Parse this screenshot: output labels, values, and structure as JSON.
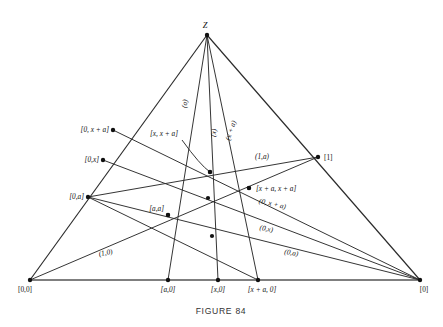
{
  "figure": {
    "caption": "FIGURE 84",
    "apex_label": "Z",
    "ink_color": "#2a2a2a",
    "baseline_color": "#555555",
    "background_color": "#ffffff"
  },
  "vertices": {
    "apex": {
      "label": "Z",
      "x": 207,
      "y": 35
    },
    "bottom_left": {
      "label": "[0,0]",
      "x": 30,
      "y": 280
    },
    "bottom_right": {
      "label": "[0]",
      "x": 420,
      "y": 280
    }
  },
  "points": [
    {
      "name": "apex-z",
      "label": "Z",
      "x": 207,
      "y": 35,
      "lx": 205,
      "ly": 28,
      "anchor": "middle",
      "italic": true
    },
    {
      "name": "origin",
      "label": "[0,0]",
      "x": 30,
      "y": 280,
      "lx": 18,
      "ly": 292,
      "anchor": "start",
      "italic": false
    },
    {
      "name": "pt-a0",
      "label": "[a,0]",
      "x": 168,
      "y": 280,
      "lx": 168,
      "ly": 292,
      "anchor": "middle",
      "italic": true
    },
    {
      "name": "pt-x0",
      "label": "[x,0]",
      "x": 218,
      "y": 280,
      "lx": 218,
      "ly": 292,
      "anchor": "middle",
      "italic": true
    },
    {
      "name": "pt-xa0",
      "label": "[x + a, 0]",
      "x": 258,
      "y": 280,
      "lx": 262,
      "ly": 292,
      "anchor": "middle",
      "italic": true
    },
    {
      "name": "pt-zero",
      "label": "[0]",
      "x": 420,
      "y": 280,
      "lx": 424,
      "ly": 292,
      "anchor": "middle",
      "italic": false
    },
    {
      "name": "pt-0xa",
      "label": "[0, x + a]",
      "x": 113,
      "y": 130,
      "lx": 109,
      "ly": 132,
      "anchor": "end",
      "italic": true
    },
    {
      "name": "pt-0x",
      "label": "[0,x]",
      "x": 103,
      "y": 160,
      "lx": 99,
      "ly": 162,
      "anchor": "end",
      "italic": true
    },
    {
      "name": "pt-0a",
      "label": "[0,a]",
      "x": 88,
      "y": 197,
      "lx": 84,
      "ly": 199,
      "anchor": "end",
      "italic": true
    },
    {
      "name": "pt-one",
      "label": "[1]",
      "x": 318,
      "y": 157,
      "lx": 324,
      "ly": 160,
      "anchor": "start",
      "italic": false
    },
    {
      "name": "pt-aa",
      "label": "[a,a]",
      "x": 168,
      "y": 215,
      "lx": 164,
      "ly": 211,
      "anchor": "end",
      "italic": true
    },
    {
      "name": "pt-x-xa",
      "label": "[x, x + a]",
      "x": 210,
      "y": 172,
      "lx": 150,
      "ly": 136,
      "anchor": "start",
      "italic": true
    },
    {
      "name": "pt-xa-xa",
      "label": "[x + a, x + a]",
      "x": 249,
      "y": 188,
      "lx": 256,
      "ly": 191,
      "anchor": "start",
      "italic": true
    }
  ],
  "line_labels": [
    {
      "name": "label-a",
      "text": "(a)",
      "x": 187,
      "y": 104,
      "rotate": -80,
      "italic": true
    },
    {
      "name": "label-x",
      "text": "(x)",
      "x": 216,
      "y": 133,
      "rotate": -82,
      "italic": true
    },
    {
      "name": "label-x-a",
      "text": "(x + a)",
      "x": 233,
      "y": 131,
      "rotate": -72,
      "italic": true
    },
    {
      "name": "label-1-a",
      "text": "(1,a)",
      "x": 262,
      "y": 159,
      "rotate": 0,
      "italic": true
    },
    {
      "name": "label-0-x-a",
      "text": "(0, x + a)",
      "x": 272,
      "y": 206,
      "rotate": 13,
      "italic": true
    },
    {
      "name": "label-0-x",
      "text": "(0,x)",
      "x": 266,
      "y": 231,
      "rotate": 10,
      "italic": true
    },
    {
      "name": "label-0-a",
      "text": "(0,a)",
      "x": 291,
      "y": 255,
      "rotate": 9,
      "italic": true
    },
    {
      "name": "label-1-0",
      "text": "(1,0)",
      "x": 106,
      "y": 255,
      "rotate": -11,
      "italic": true
    }
  ],
  "segments": [
    {
      "name": "edge-left",
      "kind": "edge",
      "x1": 207,
      "y1": 35,
      "x2": 30,
      "y2": 280
    },
    {
      "name": "edge-right",
      "kind": "edge",
      "x1": 207,
      "y1": 35,
      "x2": 420,
      "y2": 280
    },
    {
      "name": "edge-base",
      "kind": "baseline",
      "x1": 30,
      "y1": 280,
      "x2": 420,
      "y2": 280
    },
    {
      "name": "cevian-z-a0",
      "kind": "chord",
      "x1": 207,
      "y1": 35,
      "x2": 168,
      "y2": 280
    },
    {
      "name": "cevian-z-x0",
      "kind": "chord",
      "x1": 207,
      "y1": 35,
      "x2": 218,
      "y2": 280
    },
    {
      "name": "cevian-z-xa0",
      "kind": "chord",
      "x1": 207,
      "y1": 35,
      "x2": 258,
      "y2": 280
    },
    {
      "name": "chord-0xa-zero",
      "kind": "chord",
      "x1": 113,
      "y1": 130,
      "x2": 420,
      "y2": 280
    },
    {
      "name": "chord-0x-zero",
      "kind": "chord",
      "x1": 103,
      "y1": 160,
      "x2": 420,
      "y2": 280
    },
    {
      "name": "chord-0a-zero",
      "kind": "chord",
      "x1": 88,
      "y1": 197,
      "x2": 420,
      "y2": 280
    },
    {
      "name": "chord-origin-one",
      "kind": "chord",
      "x1": 30,
      "y1": 280,
      "x2": 318,
      "y2": 157
    },
    {
      "name": "chord-0a-one",
      "kind": "chord",
      "x1": 88,
      "y1": 197,
      "x2": 318,
      "y2": 157
    },
    {
      "name": "chord-0a-xa0",
      "kind": "chord",
      "x1": 88,
      "y1": 197,
      "x2": 258,
      "y2": 280
    }
  ],
  "intersection_dots": [
    {
      "name": "dot-center-upper",
      "x": 210,
      "y": 172
    },
    {
      "name": "dot-center-mid",
      "x": 208,
      "y": 198
    },
    {
      "name": "dot-xa-xa",
      "x": 249,
      "y": 188
    },
    {
      "name": "dot-aa",
      "x": 168,
      "y": 215
    },
    {
      "name": "dot-lower-mid",
      "x": 212,
      "y": 236
    }
  ],
  "leader": {
    "name": "leader-x-xa",
    "from_x": 182,
    "from_y": 140,
    "ctrl_x": 200,
    "ctrl_y": 165,
    "to_x": 210,
    "to_y": 172
  }
}
